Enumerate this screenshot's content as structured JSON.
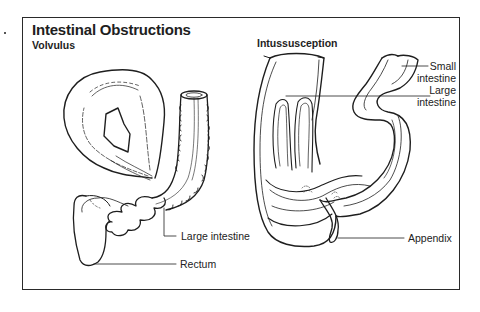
{
  "figure": {
    "title": "Intestinal Obstructions"
  },
  "panels": {
    "volvulus": {
      "heading": "Volvulus",
      "labels": {
        "large_intestine": "Large intestine",
        "rectum": "Rectum"
      }
    },
    "intussusception": {
      "heading": "Intussusception",
      "labels": {
        "small_intestine_line1": "Small",
        "small_intestine_line2": "intestine",
        "large_intestine_line1": "Large",
        "large_intestine_line2": "intestine",
        "appendix": "Appendix"
      }
    }
  },
  "colors": {
    "ink": "#1e1e1e",
    "background": "#ffffff"
  }
}
